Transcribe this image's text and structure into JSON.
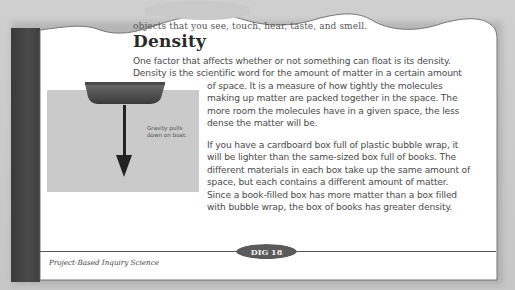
{
  "page": {
    "top_partial_line_hidden": "...called w...",
    "top_partial_line": "objects that you see, touch, hear, taste, and smell.",
    "heading": "Density",
    "paragraph1_line1": "One factor that affects whether or not something can float is its density.",
    "paragraph1_line2": "Density is the scientific word for the amount of matter in a certain amount",
    "paragraph1_rest": "of space. It is a measure of how tightly the molecules making up matter are packed together in the space. The more room the molecules have in a given space, the less dense the matter will be.",
    "paragraph2": "If you have a cardboard box full of plastic bubble wrap, it will be lighter than the same-sized box full of books. The different materials in each box take up the same amount of space, but each contains a different amount of matter. Since a book-filled box has more matter than a box filled with bubble wrap, the box of books has greater density."
  },
  "figure": {
    "label": "Gravity pulls down on boat.",
    "icons": [
      "boat-icon",
      "down-arrow-icon"
    ],
    "colors": {
      "water": "#cacaca",
      "boat": "#4f4f4f",
      "arrow": "#222222"
    }
  },
  "footer": {
    "publisher": "Project-Based Inquiry Science",
    "page_badge": "DIG 18"
  },
  "colors": {
    "background": "#c9c9c9",
    "page": "#ffffff",
    "spine": "#444444",
    "badge": "#5a5a5a",
    "heading": "#2a2a2a",
    "body_text": "#4a4a4a"
  }
}
